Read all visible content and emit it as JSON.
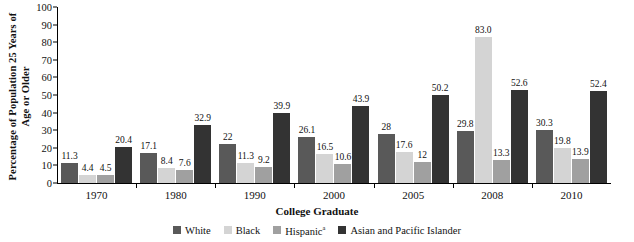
{
  "chart_data": {
    "type": "bar",
    "title": "",
    "xlabel": "College Graduate",
    "ylabel": "Percentage of Population 25 Years of Age or Older",
    "ylim": [
      0,
      100
    ],
    "ytick_step": 10,
    "yticks": [
      "100",
      "90",
      "80",
      "70",
      "60",
      "50",
      "40",
      "30",
      "20",
      "10",
      "0"
    ],
    "grid": false,
    "legend_position": "bottom",
    "categories": [
      "1970",
      "1980",
      "1990",
      "2000",
      "2005",
      "2008",
      "2010"
    ],
    "series": [
      {
        "name": "White",
        "color": "#595959",
        "values": [
          11.3,
          17.1,
          22,
          26.1,
          28,
          29.8,
          30.3
        ],
        "labels": [
          "11.3",
          "17.1",
          "22",
          "26.1",
          "28",
          "29.8",
          "30.3"
        ]
      },
      {
        "name": "Black",
        "color": "#d4d4d4",
        "values": [
          4.4,
          8.4,
          11.3,
          16.5,
          17.6,
          83.0,
          19.8
        ],
        "labels": [
          "4.4",
          "8.4",
          "11.3",
          "16.5",
          "17.6",
          "83.0",
          "19.8"
        ]
      },
      {
        "name": "Hispanic",
        "name_suffix": "a",
        "color": "#a0a0a0",
        "values": [
          4.5,
          7.6,
          9.2,
          10.6,
          12,
          13.3,
          13.9
        ],
        "labels": [
          "4.5",
          "7.6",
          "9.2",
          "10.6",
          "12",
          "13.3",
          "13.9"
        ]
      },
      {
        "name": "Asian and Pacific Islander",
        "color": "#333333",
        "values": [
          20.4,
          32.9,
          39.9,
          43.9,
          50.2,
          52.6,
          52.4
        ],
        "labels": [
          "20.4",
          "32.9",
          "39.9",
          "43.9",
          "50.2",
          "52.6",
          "52.4"
        ]
      }
    ]
  },
  "legend": {
    "items": [
      {
        "label": "White",
        "suffix": "",
        "color": "#595959"
      },
      {
        "label": "Black",
        "suffix": "",
        "color": "#d4d4d4"
      },
      {
        "label": "Hispanic",
        "suffix": "a",
        "color": "#a0a0a0"
      },
      {
        "label": "Asian and Pacific Islander",
        "suffix": "",
        "color": "#333333"
      }
    ]
  }
}
